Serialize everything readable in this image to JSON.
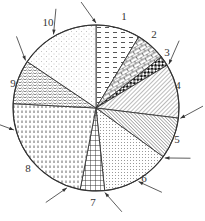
{
  "chart_data": {
    "type": "pie",
    "title": "",
    "start_angle_deg": 0,
    "direction": "clockwise",
    "categories": [
      "1",
      "2",
      "3",
      "4",
      "5",
      "6",
      "7",
      "8",
      "9",
      "10"
    ],
    "values_deg": [
      31,
      21,
      7,
      38,
      29,
      48,
      17,
      82,
      31,
      56
    ],
    "values_percent": [
      8.6,
      5.8,
      1.9,
      10.6,
      8.1,
      13.3,
      4.7,
      22.8,
      8.6,
      15.6
    ],
    "patterns": [
      "dashes",
      "brick",
      "checker",
      "diagonal-fine",
      "diagonal-dense",
      "dots-fine",
      "grid",
      "vertical-dashes",
      "wave",
      "sparse-dots"
    ],
    "legend": "none (numeric labels around pie with arrows)",
    "annotations": "arrows pointing to slice boundaries / rim"
  },
  "labels": [
    "1",
    "2",
    "3",
    "4",
    "5",
    "6",
    "7",
    "8",
    "9",
    "10"
  ],
  "colors": {
    "stroke": "#333333",
    "background": "#ffffff"
  }
}
